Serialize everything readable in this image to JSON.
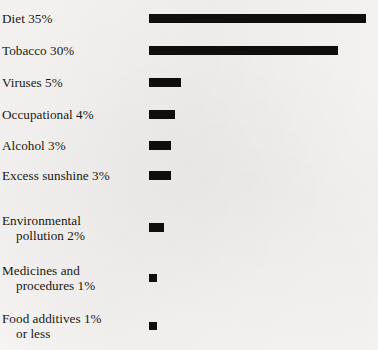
{
  "figure": {
    "background_color": "#f8f7f5",
    "bar_color": "#100d0a",
    "text_color": "#1a1712"
  },
  "chart_data": {
    "type": "bar",
    "orientation": "horizontal",
    "title": "",
    "subtitle": "",
    "xlabel": "",
    "ylabel": "",
    "xlim": [
      0,
      35
    ],
    "grid": false,
    "legend": false,
    "axis_visible": false,
    "value_unit": "%",
    "categories": [
      "Diet",
      "Tobacco",
      "Viruses",
      "Occupational",
      "Alcohol",
      "Excess sunshine",
      "Environmental pollution",
      "Medicines and procedures",
      "Food additives"
    ],
    "values": [
      35,
      30,
      5,
      4,
      3,
      3,
      2,
      1,
      1
    ],
    "labels": [
      "Diet 35%",
      "Tobacco 30%",
      "Viruses 5%",
      "Occupational 4%",
      "Alcohol 3%",
      "Excess sunshine 3%",
      "Environmental pollution 2%",
      "Medicines and procedures 1%",
      "Food additives 1% or less"
    ]
  },
  "rows": [
    {
      "name": "diet",
      "line1": "Diet 35%",
      "line2": "",
      "value": 35,
      "value_text": "35%",
      "bar_px": 217,
      "y": 19,
      "tiny": false
    },
    {
      "name": "tobacco",
      "line1": "Tobacco 30%",
      "line2": "",
      "value": 30,
      "value_text": "30%",
      "bar_px": 189,
      "y": 51,
      "tiny": false
    },
    {
      "name": "viruses",
      "line1": "Viruses 5%",
      "line2": "",
      "value": 5,
      "value_text": "5%",
      "bar_px": 32,
      "y": 83,
      "tiny": false
    },
    {
      "name": "occupational",
      "line1": "Occupational 4%",
      "line2": "",
      "value": 4,
      "value_text": "4%",
      "bar_px": 26,
      "y": 115,
      "tiny": false
    },
    {
      "name": "alcohol",
      "line1": "Alcohol 3%",
      "line2": "",
      "value": 3,
      "value_text": "3%",
      "bar_px": 22,
      "y": 146,
      "tiny": false
    },
    {
      "name": "excess-sunshine",
      "line1": "Excess sunshine 3%",
      "line2": "",
      "value": 3,
      "value_text": "3%",
      "bar_px": 22,
      "y": 176,
      "tiny": false
    },
    {
      "name": "environmental-pollution",
      "line1": "Environmental",
      "line2": "pollution 2%",
      "value": 2,
      "value_text": "2%",
      "bar_px": 15,
      "y": 228,
      "tiny": false
    },
    {
      "name": "medicines-and-procedures",
      "line1": "Medicines and",
      "line2": "procedures 1%",
      "value": 1,
      "value_text": "1%",
      "bar_px": 8,
      "y": 278,
      "tiny": true
    },
    {
      "name": "food-additives",
      "line1": "Food additives 1%",
      "line2": "or less",
      "value": 1,
      "value_text": "1% or less",
      "bar_px": 8,
      "y": 326,
      "tiny": true
    }
  ]
}
